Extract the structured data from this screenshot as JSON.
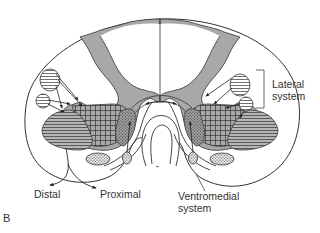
{
  "figure": {
    "panel_letter": "B",
    "labels": {
      "lateral_line1": "Lateral",
      "lateral_line2": "system",
      "ventromedial_line1": "Ventromedial",
      "ventromedial_line2": "system",
      "distal": "Distal",
      "proximal": "Proximal"
    },
    "colors": {
      "gray_matter": "#a8a8a8",
      "outline": "#333333",
      "background": "#ffffff",
      "text": "#333333"
    }
  }
}
